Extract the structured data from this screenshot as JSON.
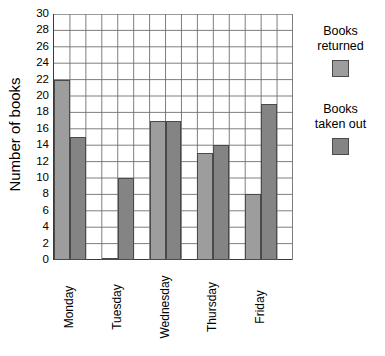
{
  "chart_data": {
    "type": "bar",
    "title": "",
    "xlabel": "",
    "ylabel": "Number of books",
    "categories": [
      "Monday",
      "Tuesday",
      "Wednesday",
      "Thursday",
      "Friday"
    ],
    "series": [
      {
        "name": "Books returned",
        "values": [
          22,
          0,
          17,
          13,
          8
        ],
        "color": "#9d9d9d"
      },
      {
        "name": "Books taken out",
        "values": [
          15,
          10,
          17,
          14,
          19
        ],
        "color": "#848484"
      }
    ],
    "ylim": [
      0,
      30
    ],
    "ytick_step": 2,
    "yticks": [
      0,
      2,
      4,
      6,
      8,
      10,
      12,
      14,
      16,
      18,
      20,
      22,
      24,
      26,
      28,
      30
    ],
    "ytick_labels": [
      "0",
      "2",
      "4",
      "6",
      "8",
      "10",
      "12",
      "14",
      "16",
      "18",
      "20",
      "22",
      "24",
      "26",
      "28",
      "30"
    ],
    "grid": true,
    "grid_columns": 15,
    "legend_position": "right",
    "legend": [
      {
        "label": "Books\nreturned",
        "color": "#9d9d9d"
      },
      {
        "label": "Books\ntaken out",
        "color": "#848484"
      }
    ]
  },
  "axis": {
    "y_title": "Number of books"
  }
}
